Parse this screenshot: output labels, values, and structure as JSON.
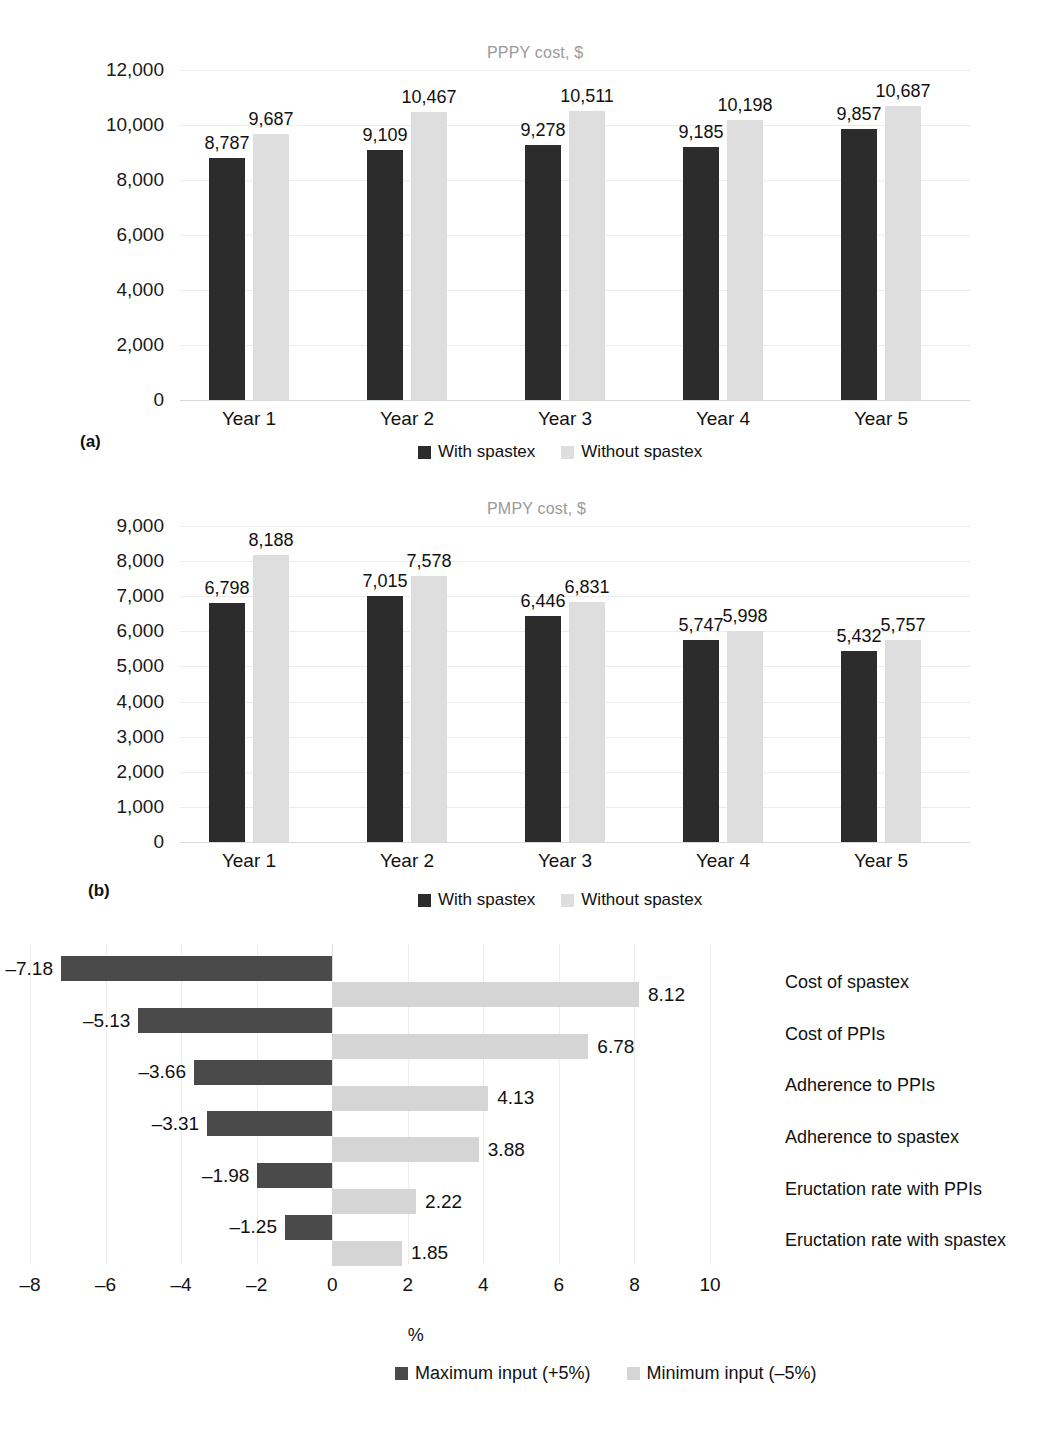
{
  "chart_data": [
    {
      "type": "bar",
      "panel": "a",
      "panel_tag": "(a)",
      "title": "PPPY cost, $",
      "categories": [
        "Year 1",
        "Year 2",
        "Year 3",
        "Year 4",
        "Year 5"
      ],
      "series": [
        {
          "name": "With spastex",
          "values": [
            8787,
            9109,
            9278,
            9185,
            9857
          ],
          "labels": [
            "8,787",
            "9,109",
            "9,278",
            "9,185",
            "9,857"
          ],
          "color": "#2c2c2c"
        },
        {
          "name": "Without spastex",
          "values": [
            9687,
            10467,
            10511,
            10198,
            10687
          ],
          "labels": [
            "9,687",
            "10,467",
            "10,511",
            "10,198",
            "10,687"
          ],
          "color": "#dedede"
        }
      ],
      "xlabel": "",
      "ylabel": "",
      "ylim": [
        0,
        12000
      ],
      "yticks": [
        0,
        2000,
        4000,
        6000,
        8000,
        10000,
        12000
      ],
      "ytick_labels": [
        "0",
        "2,000",
        "4,000",
        "6,000",
        "8,000",
        "10,000",
        "12,000"
      ],
      "grid": true,
      "legend_position": "bottom"
    },
    {
      "type": "bar",
      "panel": "b",
      "panel_tag": "(b)",
      "title": "PMPY cost, $",
      "categories": [
        "Year 1",
        "Year 2",
        "Year 3",
        "Year 4",
        "Year 5"
      ],
      "series": [
        {
          "name": "With spastex",
          "values": [
            6798,
            7015,
            6446,
            5747,
            5432
          ],
          "labels": [
            "6,798",
            "7,015",
            "6,446",
            "5,747",
            "5,432"
          ],
          "color": "#2c2c2c"
        },
        {
          "name": "Without spastex",
          "values": [
            8188,
            7578,
            6831,
            5998,
            5757
          ],
          "labels": [
            "8,188",
            "7,578",
            "6,831",
            "5,998",
            "5,757"
          ],
          "color": "#dedede"
        }
      ],
      "xlabel": "",
      "ylabel": "",
      "ylim": [
        0,
        9000
      ],
      "yticks": [
        0,
        1000,
        2000,
        3000,
        4000,
        5000,
        6000,
        7000,
        8000,
        9000
      ],
      "ytick_labels": [
        "0",
        "1,000",
        "2,000",
        "3,000",
        "4,000",
        "5,000",
        "6,000",
        "7,000",
        "8,000",
        "9,000"
      ],
      "grid": true,
      "legend_position": "bottom"
    },
    {
      "type": "bar",
      "panel": "c",
      "panel_tag": ")",
      "title": "",
      "orientation": "horizontal",
      "style": "tornado",
      "categories": [
        "Cost of spastex",
        "Cost of PPIs",
        "Adherence to PPIs",
        "Adherence to spastex",
        "Eructation rate with PPIs",
        "Eructation rate with spastex"
      ],
      "series": [
        {
          "name": "Maximum input (+5%)",
          "values": [
            -7.18,
            -5.13,
            -3.66,
            -3.31,
            -1.98,
            -1.25
          ],
          "labels": [
            "–7.18",
            "–5.13",
            "–3.66",
            "–3.31",
            "–1.98",
            "–1.25"
          ],
          "color": "#4a4a4a"
        },
        {
          "name": "Minimum input (–5%)",
          "values": [
            8.12,
            6.78,
            4.13,
            3.88,
            2.22,
            1.85
          ],
          "labels": [
            "8.12",
            "6.78",
            "4.13",
            "3.88",
            "2.22",
            "1.85"
          ],
          "color": "#d5d5d5"
        }
      ],
      "xlabel": "%",
      "ylabel": "",
      "xlim": [
        -8,
        10
      ],
      "xticks": [
        -8,
        -6,
        -4,
        -2,
        0,
        2,
        4,
        6,
        8,
        10
      ],
      "xtick_labels": [
        "–8",
        "–6",
        "–4",
        "–2",
        "0",
        "2",
        "4",
        "6",
        "8",
        "10"
      ],
      "grid": true,
      "legend_position": "bottom"
    }
  ],
  "colors": {
    "dark_bar": "#2c2c2c",
    "light_bar": "#dedede",
    "tornado_dark": "#4a4a4a",
    "tornado_light": "#d5d5d5",
    "gridline": "#ececec",
    "title_text": "#9a9a9a",
    "body_text": "#1a1a1a",
    "background": "#ffffff"
  }
}
